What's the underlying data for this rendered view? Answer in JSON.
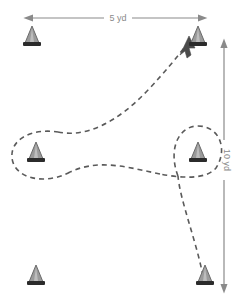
{
  "diagram": {
    "background_color": "#ffffff",
    "dimensions": {
      "horizontal": {
        "label": "5 yd",
        "name": "width-dimension",
        "color": "#8a8a8a",
        "orientation": "horizontal",
        "arrow": "double"
      },
      "vertical": {
        "label": "10 yd",
        "name": "height-dimension",
        "color": "#8a8a8a",
        "orientation": "vertical",
        "arrow": "double"
      }
    },
    "cones": [
      {
        "name": "cone-top-left",
        "x": 32,
        "y": 46,
        "label": ""
      },
      {
        "name": "cone-top-right",
        "x": 198,
        "y": 46,
        "label": ""
      },
      {
        "name": "cone-middle-left",
        "x": 36,
        "y": 162,
        "label": ""
      },
      {
        "name": "cone-middle-right",
        "x": 198,
        "y": 162,
        "label": ""
      },
      {
        "name": "cone-bottom-left",
        "x": 36,
        "y": 285,
        "label": ""
      },
      {
        "name": "cone-bottom-right",
        "x": 205,
        "y": 285,
        "label": ""
      }
    ],
    "cone_style": {
      "body_color": "#9a9a9a",
      "outline_color": "#6b6b6b",
      "base_color": "#2b2b2b",
      "width": 17,
      "height": 22
    },
    "path": {
      "name": "drill-route",
      "style": "dashed",
      "color": "#5a5a5a",
      "dash": "5,4",
      "width": 1.6,
      "direction": "start at bottom-right cone, loop right cone, cross to left cone loop, then diagonal up to top-right cone",
      "has_arrowhead": true,
      "arrowhead_at": "top-right"
    }
  }
}
